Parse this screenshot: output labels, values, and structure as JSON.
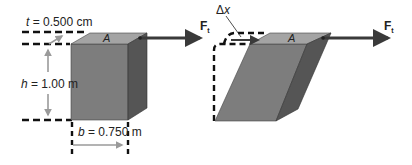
{
  "left_figure": {
    "thickness_label": {
      "var": "t",
      "eq": " = 0.500 cm"
    },
    "height_label": {
      "var": "h",
      "eq": " = 1.00 m"
    },
    "base_label": {
      "var": "b",
      "eq": " = 0.750 m"
    },
    "area_label": "A",
    "force_label": {
      "main": "F",
      "sub": "t"
    }
  },
  "right_figure": {
    "displacement_label": {
      "delta": "Δ",
      "var": "x"
    },
    "area_label": "A",
    "force_label": {
      "main": "F",
      "sub": "t"
    }
  },
  "colors": {
    "front_face": "#7d7d7d",
    "top_face": "#a4a4a4",
    "side_face": "#555555",
    "arrow": "#3a3a3a",
    "dimension_arrow": "#9a9a9a",
    "dash": "#111111"
  }
}
